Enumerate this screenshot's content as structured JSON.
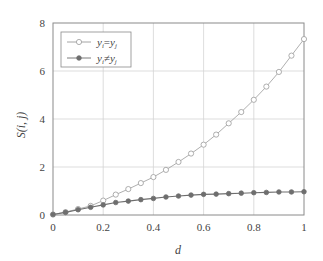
{
  "chart_data": {
    "type": "line",
    "title": "",
    "xlabel": "d",
    "ylabel": "S(i, j)",
    "xlim": [
      0,
      1
    ],
    "ylim": [
      0,
      8
    ],
    "xticks": [
      0,
      0.2,
      0.4,
      0.6,
      0.8,
      1
    ],
    "xtick_labels": [
      "0",
      "0.2",
      "0.4",
      "0.6",
      "0.8",
      "1"
    ],
    "yticks": [
      0,
      2,
      4,
      6,
      8
    ],
    "ytick_labels": [
      "0",
      "2",
      "4",
      "6",
      "8"
    ],
    "grid": true,
    "legend_position": "top-left",
    "x": [
      0,
      0.05,
      0.1,
      0.15,
      0.2,
      0.25,
      0.3,
      0.35,
      0.4,
      0.45,
      0.5,
      0.55,
      0.6,
      0.65,
      0.7,
      0.75,
      0.8,
      0.85,
      0.9,
      0.95,
      1.0
    ],
    "series": [
      {
        "name": "y_i=y_j",
        "legend_main": "y",
        "legend_sub1": "i",
        "legend_op": "=",
        "legend_sub2": "j",
        "marker": "open-circle",
        "color": "#9a9a9a",
        "values": [
          0.02,
          0.12,
          0.25,
          0.38,
          0.6,
          0.85,
          1.08,
          1.33,
          1.58,
          1.88,
          2.21,
          2.56,
          2.93,
          3.35,
          3.82,
          4.29,
          4.8,
          5.35,
          5.96,
          6.64,
          7.33
        ]
      },
      {
        "name": "y_i≠y_j",
        "legend_main": "y",
        "legend_sub1": "i",
        "legend_op": "≠",
        "legend_sub2": "j",
        "marker": "filled-circle",
        "color": "#6e6e6e",
        "values": [
          0.02,
          0.11,
          0.22,
          0.32,
          0.42,
          0.52,
          0.58,
          0.64,
          0.69,
          0.75,
          0.79,
          0.83,
          0.86,
          0.87,
          0.89,
          0.91,
          0.93,
          0.94,
          0.96,
          0.96,
          0.97
        ]
      }
    ]
  }
}
